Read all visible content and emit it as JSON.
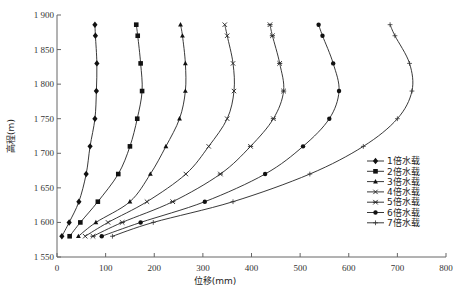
{
  "chart_data": {
    "type": "line",
    "title": "",
    "xlabel": "位移(mm)",
    "ylabel": "高程(m)",
    "xlim": [
      0,
      800
    ],
    "ylim": [
      1550,
      1900
    ],
    "xticks": [
      0,
      100,
      200,
      300,
      400,
      500,
      600,
      700,
      800
    ],
    "xtick_labels": [
      "0",
      "100",
      "200",
      "300",
      "400",
      "500",
      "600",
      "700",
      "800"
    ],
    "yticks": [
      1550,
      1600,
      1650,
      1700,
      1750,
      1800,
      1850,
      1900
    ],
    "ytick_labels": [
      "1 550",
      "1 600",
      "1 650",
      "1 700",
      "1 750",
      "1 800",
      "1 850",
      "1 900"
    ],
    "grid": false,
    "legend_position": "lower right",
    "elevations": [
      1886,
      1870,
      1830,
      1790,
      1750,
      1710,
      1670,
      1630,
      1600,
      1580
    ],
    "series": [
      {
        "name": "1倍水载",
        "marker": "diamond",
        "x": [
          78,
          79,
          82,
          81,
          78,
          68,
          60,
          45,
          25,
          10
        ]
      },
      {
        "name": "2倍水载",
        "marker": "square",
        "x": [
          163,
          166,
          172,
          175,
          165,
          150,
          126,
          84,
          48,
          26
        ]
      },
      {
        "name": "3倍水载",
        "marker": "triangle",
        "x": [
          254,
          258,
          264,
          264,
          252,
          224,
          192,
          150,
          80,
          44
        ]
      },
      {
        "name": "4倍水载",
        "marker": "x",
        "x": [
          345,
          350,
          362,
          364,
          350,
          312,
          265,
          185,
          105,
          58
        ]
      },
      {
        "name": "5倍水载",
        "marker": "asterisk",
        "x": [
          438,
          443,
          458,
          466,
          445,
          398,
          336,
          238,
          134,
          74
        ]
      },
      {
        "name": "6倍水载",
        "marker": "circle",
        "x": [
          538,
          546,
          568,
          580,
          560,
          506,
          428,
          304,
          172,
          92
        ]
      },
      {
        "name": "7倍水载",
        "marker": "plus",
        "x": [
          685,
          695,
          725,
          730,
          700,
          630,
          520,
          362,
          198,
          114
        ]
      }
    ]
  }
}
